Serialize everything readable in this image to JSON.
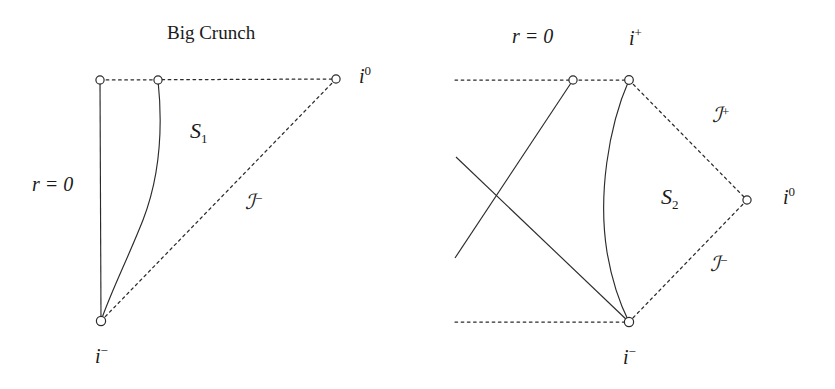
{
  "figure": {
    "background_color": "#ffffff",
    "line_color": "#2b2b2b",
    "node_fill": "#ffffff",
    "node_stroke": "#2b2b2b"
  },
  "left_diagram": {
    "name": "big-crunch-diagram",
    "heading": "Big Crunch",
    "labels": {
      "radial_origin": "r = 0",
      "spatial_infinity": "i",
      "spatial_infinity_sup": "0",
      "past_timelike_infinity": "i",
      "past_timelike_infinity_sup": "−",
      "surface": "S",
      "surface_sub": "1",
      "past_null_infinity": "ℐ",
      "past_null_infinity_sup": "−"
    },
    "nodes": [
      {
        "id": "crunch-left-node",
        "x": 100,
        "y": 80
      },
      {
        "id": "crunch-mid-node",
        "x": 158,
        "y": 80
      },
      {
        "id": "spatial-infinity-node",
        "x": 336,
        "y": 79
      },
      {
        "id": "past-timelike-infinity-node",
        "x": 101,
        "y": 321
      }
    ],
    "edges": [
      {
        "id": "big-crunch-line",
        "style": "dotted",
        "from": [
          100,
          80
        ],
        "to": [
          336,
          79
        ]
      },
      {
        "id": "axis-line",
        "style": "solid",
        "from": [
          100,
          80
        ],
        "to": [
          101,
          321
        ]
      },
      {
        "id": "past-null-infinity-line",
        "style": "dotted",
        "from": [
          336,
          79
        ],
        "to": [
          101,
          321
        ]
      },
      {
        "id": "s1-curve",
        "style": "solid-curve",
        "from": [
          158,
          80
        ],
        "to": [
          101,
          321
        ]
      }
    ]
  },
  "right_diagram": {
    "name": "asymptotically-flat-diagram",
    "labels": {
      "radial_origin": "r = 0",
      "future_timelike_infinity": "i",
      "future_timelike_infinity_sup": "+",
      "spatial_infinity": "i",
      "spatial_infinity_sup": "0",
      "past_timelike_infinity": "i",
      "past_timelike_infinity_sup": "−",
      "surface": "S",
      "surface_sub": "2",
      "future_null_infinity": "ℐ",
      "future_null_infinity_sup": "+",
      "past_null_infinity": "ℐ",
      "past_null_infinity_sup": "−"
    },
    "nodes": [
      {
        "id": "origin-top-node",
        "x": 573,
        "y": 80
      },
      {
        "id": "future-timelike-infinity-node",
        "x": 629,
        "y": 80
      },
      {
        "id": "spatial-infinity-node",
        "x": 747,
        "y": 200
      },
      {
        "id": "past-timelike-infinity-node",
        "x": 629,
        "y": 322
      }
    ],
    "edges": [
      {
        "id": "top-dotted-line",
        "style": "dotted",
        "from": [
          455,
          80
        ],
        "to": [
          629,
          80
        ]
      },
      {
        "id": "bottom-dotted-line",
        "style": "dotted",
        "from": [
          455,
          322
        ],
        "to": [
          629,
          322
        ]
      },
      {
        "id": "future-null-infinity-line",
        "style": "dotted",
        "from": [
          629,
          80
        ],
        "to": [
          747,
          200
        ]
      },
      {
        "id": "past-null-infinity-line",
        "style": "dotted",
        "from": [
          747,
          200
        ],
        "to": [
          629,
          322
        ]
      },
      {
        "id": "ingoing-ray",
        "style": "solid",
        "from": [
          573,
          80
        ],
        "to": [
          455,
          258
        ]
      },
      {
        "id": "outgoing-ray",
        "style": "solid",
        "from": [
          629,
          322
        ],
        "to": [
          456,
          157
        ]
      },
      {
        "id": "s2-curve",
        "style": "solid-curve",
        "from": [
          629,
          80
        ],
        "to": [
          629,
          322
        ]
      }
    ]
  }
}
